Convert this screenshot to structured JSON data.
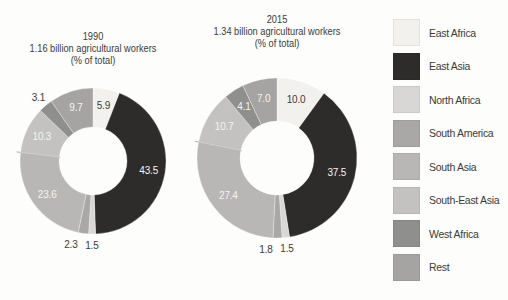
{
  "background": "#fdfdfc",
  "text_color": "#3b3b3b",
  "chart_data": [
    {
      "type": "pie",
      "subtype": "donut",
      "title": "1990",
      "subtitle": "1.16 billion agricultural workers",
      "note": "(% of total)",
      "categories": [
        "East Africa",
        "East Asia",
        "North Africa",
        "South America",
        "South Asia",
        "South-East Asia",
        "West Africa",
        "Rest"
      ],
      "values": [
        5.9,
        43.5,
        1.5,
        2.3,
        23.6,
        10.3,
        3.1,
        9.7
      ],
      "labels": [
        "5.9",
        "43.5",
        "1.5",
        "2.3",
        "23.6",
        "10.3",
        "3.1",
        "9.7"
      ],
      "start_angle_deg": 0,
      "direction": "clockwise",
      "outer_radius": 73,
      "inner_radius": 34
    },
    {
      "type": "pie",
      "subtype": "donut",
      "title": "2015",
      "subtitle": "1.34 billion agricultural workers",
      "note": "(% of total)",
      "categories": [
        "East Africa",
        "East Asia",
        "North Africa",
        "South America",
        "South Asia",
        "South-East Asia",
        "West Africa",
        "Rest"
      ],
      "values": [
        10.0,
        37.5,
        1.5,
        1.8,
        27.4,
        10.7,
        4.1,
        7.0
      ],
      "labels": [
        "10.0",
        "37.5",
        "1.5",
        "1.8",
        "27.4",
        "10.7",
        "4.1",
        "7.0"
      ],
      "start_angle_deg": 0,
      "direction": "clockwise",
      "outer_radius": 80,
      "inner_radius": 37
    }
  ],
  "legend": {
    "position": "right",
    "items": [
      {
        "label": "East Africa",
        "color": "#f2f1ed"
      },
      {
        "label": "East Asia",
        "color": "#2d2c2b"
      },
      {
        "label": "North Africa",
        "color": "#d8d7d5"
      },
      {
        "label": "South America",
        "color": "#a9a8a6"
      },
      {
        "label": "South Asia",
        "color": "#b8b7b5"
      },
      {
        "label": "South-East Asia",
        "color": "#c3c2c0"
      },
      {
        "label": "West Africa",
        "color": "#8f8f8d"
      },
      {
        "label": "Rest",
        "color": "#a5a4a2"
      }
    ]
  }
}
